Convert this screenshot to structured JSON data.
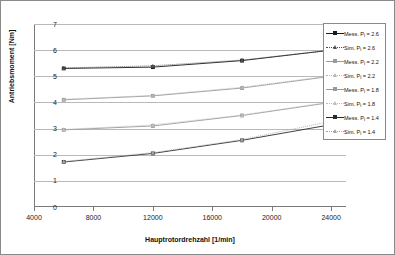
{
  "chart_data": {
    "type": "line",
    "title": "",
    "xlabel": "Hauptrotordrehzahl [1/min]",
    "ylabel": "Antriebsmoment [Nm]",
    "xlim": [
      4000,
      25000
    ],
    "ylim": [
      0,
      7
    ],
    "xticks": [
      4000,
      8000,
      12000,
      16000,
      20000,
      24000
    ],
    "yticks": [
      0,
      1,
      2,
      3,
      4,
      5,
      6,
      7
    ],
    "xtick_labels": [
      "4000",
      "8000",
      "12000",
      "16000",
      "20000",
      "24000"
    ],
    "ytick_labels": [
      "0",
      "1",
      "2",
      "3",
      "4",
      "5",
      "6",
      "7"
    ],
    "grid": "horizontal",
    "legend_position": "right-top",
    "x": [
      6000,
      12000,
      18000,
      24000
    ],
    "series": [
      {
        "name": "Mess. Pi = 2.6",
        "values": [
          5.3,
          5.35,
          5.6,
          6.0
        ],
        "color": "#1a1a1a",
        "marker": "square",
        "line": "solid"
      },
      {
        "name": "Sim. Pi = 2.6",
        "values": [
          5.32,
          5.4,
          5.62,
          6.0
        ],
        "color": "#4d4d4d",
        "marker": "triangle",
        "line": "dotted"
      },
      {
        "name": "Mess. Pi = 2.2",
        "values": [
          4.1,
          4.25,
          4.55,
          5.0
        ],
        "color": "#9a9a9a",
        "marker": "square",
        "line": "solid"
      },
      {
        "name": "Sim. Pi = 2.2",
        "values": [
          4.12,
          4.27,
          4.58,
          5.02
        ],
        "color": "#b5b5b5",
        "marker": "triangle",
        "line": "dotted"
      },
      {
        "name": "Mess. Pi = 1.8",
        "values": [
          2.95,
          3.1,
          3.5,
          4.0
        ],
        "color": "#9a9a9a",
        "marker": "square",
        "line": "solid"
      },
      {
        "name": "Sim. Pi = 1.8",
        "values": [
          2.97,
          3.14,
          3.52,
          4.02
        ],
        "color": "#bdbdbd",
        "marker": "triangle",
        "line": "dotted"
      },
      {
        "name": "Mess. Pi = 1.4",
        "values": [
          1.72,
          2.05,
          2.55,
          3.15
        ],
        "color": "#2b2b2b",
        "marker": "square",
        "line": "solid"
      },
      {
        "name": "Sim. Pi = 1.4",
        "values": [
          1.74,
          2.08,
          2.58,
          3.28
        ],
        "color": "#a5a5a5",
        "marker": "triangle",
        "line": "dotted"
      }
    ]
  },
  "legend": {
    "entries": [
      {
        "prefix": "Mess. P",
        "sub": "i",
        "suffix": " = 2.6"
      },
      {
        "prefix": "Sim. P",
        "sub": "i",
        "suffix": " = 2.6"
      },
      {
        "prefix": "Mess. P",
        "sub": "i",
        "suffix": " = 2.2"
      },
      {
        "prefix": "Sim. P",
        "sub": "i",
        "suffix": " = 2.2"
      },
      {
        "prefix": "Mess. P",
        "sub": "i",
        "suffix": " = 1.8"
      },
      {
        "prefix": "Sim. P",
        "sub": "i",
        "suffix": " = 1.8"
      },
      {
        "prefix": "Mess. P",
        "sub": "i",
        "suffix": " = 1.4"
      },
      {
        "prefix": "Sim. P",
        "sub": "i",
        "suffix": " = 1.4"
      }
    ]
  }
}
